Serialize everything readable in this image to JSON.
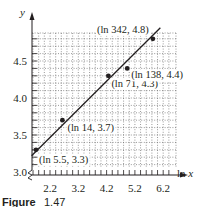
{
  "chart_data": {
    "type": "scatter",
    "title": "",
    "xlabel": "ln x",
    "ylabel": "y",
    "x_ticks": [
      2.2,
      3.2,
      4.2,
      5.2,
      6.2
    ],
    "x_tick_labels": [
      "2.2",
      "3.2",
      "4.2",
      "5.2",
      "6.2"
    ],
    "y_ticks": [
      3.0,
      3.5,
      4.0,
      4.5
    ],
    "y_tick_labels": [
      "3.0",
      "3.5",
      "4.0",
      "4.5"
    ],
    "xlim": [
      1.55,
      6.5
    ],
    "ylim": [
      3.0,
      4.95
    ],
    "grid": true,
    "axis_break_y": true,
    "points": [
      {
        "x": 1.705,
        "y": 3.3,
        "label": "(ln 5.5, 3.3)"
      },
      {
        "x": 2.639,
        "y": 3.7,
        "label": "(ln 14, 3.7)"
      },
      {
        "x": 4.263,
        "y": 4.3,
        "label": "(ln 71, 4.3)"
      },
      {
        "x": 4.927,
        "y": 4.4,
        "label": "(ln 138, 4.4)"
      },
      {
        "x": 5.835,
        "y": 4.8,
        "label": "(ln 342, 4.8)"
      }
    ],
    "fit_line": {
      "x": [
        1.55,
        6.1
      ],
      "y": [
        3.22,
        4.95
      ]
    },
    "caption": "Figure 1.47"
  },
  "caption": {
    "prefix": "Figure",
    "number": "1.47"
  }
}
